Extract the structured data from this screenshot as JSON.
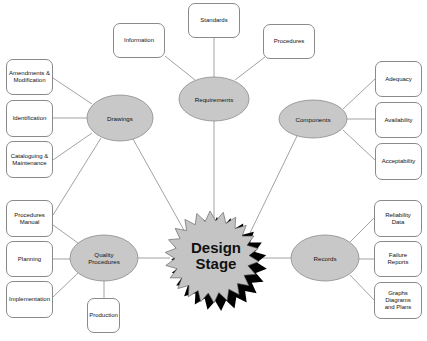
{
  "center": {
    "label": "Design\nStage"
  },
  "hubs": {
    "requirements": {
      "label": "Requirements",
      "children": [
        "Information",
        "Standards",
        "Procedures"
      ]
    },
    "drawings": {
      "label": "Drawings",
      "children": [
        "Amendments &\nModification",
        "Identification",
        "Cataloguing &\nMaintenance"
      ]
    },
    "components": {
      "label": "Components",
      "children": [
        "Adequacy",
        "Availability",
        "Acceptability"
      ]
    },
    "quality": {
      "label": "Quality\nProcedures",
      "children": [
        "Procedures\nManual",
        "Planning",
        "Implementation",
        "Production"
      ]
    },
    "records": {
      "label": "Records",
      "children": [
        "Reliability\nData",
        "Failure\nReports",
        "Graphs\nDiagrams\nand Plans"
      ]
    }
  },
  "colors": {
    "hub_fill": "#c8c8c8",
    "hub_stroke": "#8a8a8a",
    "line": "#8a8a8a",
    "star_fill": "#c4c4c4",
    "star_shadow": "#000000"
  }
}
